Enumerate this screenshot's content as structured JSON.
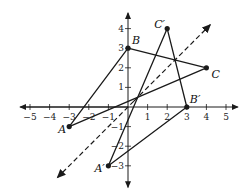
{
  "diagram": {
    "axes": {
      "x_ticks": [
        -5,
        -4,
        -3,
        -2,
        -1,
        1,
        2,
        3,
        4,
        5
      ],
      "y_ticks": [
        -3,
        -2,
        -1,
        1,
        2,
        3,
        4
      ],
      "x_range": [
        -5.5,
        5.6
      ],
      "y_range": [
        -4.1,
        4.8
      ]
    },
    "points": [
      {
        "id": "A",
        "label": "A",
        "x": -3,
        "y": -1
      },
      {
        "id": "B",
        "label": "B",
        "x": 0,
        "y": 3
      },
      {
        "id": "C",
        "label": "C",
        "x": 4,
        "y": 2
      },
      {
        "id": "A_prime",
        "label": "A′",
        "x": -1,
        "y": -3
      },
      {
        "id": "B_prime",
        "label": "B′",
        "x": 3,
        "y": 0
      },
      {
        "id": "C_prime",
        "label": "C′",
        "x": 2,
        "y": 4
      }
    ],
    "triangles": [
      {
        "name": "ABC",
        "vertices": [
          "A",
          "B",
          "C"
        ]
      },
      {
        "name": "A′B′C′",
        "vertices": [
          "A_prime",
          "B_prime",
          "C_prime"
        ]
      }
    ],
    "reflection_line": {
      "equation": "y = x",
      "style": "dashed",
      "from": [
        -3.6,
        -3.6
      ],
      "to": [
        4.2,
        4.2
      ]
    },
    "colors": {
      "stroke": "#1a1a1a",
      "background": "#ffffff"
    }
  }
}
